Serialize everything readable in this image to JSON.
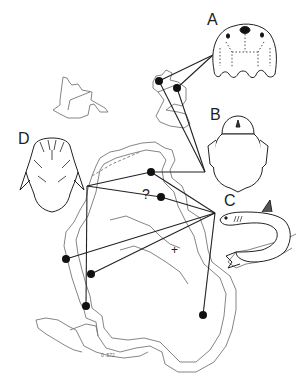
{
  "figure": {
    "type": "distribution map with specimen illustrations",
    "colors": {
      "outline": "#777777",
      "line": "#222222",
      "dot": "#111111",
      "background": "#ffffff"
    }
  },
  "labels": {
    "A": "A",
    "B": "B",
    "C": "C",
    "D": "D",
    "uncertain": "?",
    "cross": "+",
    "map_note": "0 .572"
  },
  "taxa": [
    {
      "id": "A",
      "illustration": "larval-head-capsule",
      "points": [
        [
          159,
          81
        ],
        [
          177,
          88
        ]
      ],
      "apex": [
        213,
        55
      ]
    },
    {
      "id": "B",
      "illustration": "beetle-body",
      "points": [
        [
          159,
          81
        ],
        [
          177,
          88
        ]
      ],
      "apex": [
        205,
        172
      ]
    },
    {
      "id": "C",
      "illustration": "curled-fish",
      "points": [
        [
          151,
          172
        ],
        [
          161,
          197
        ],
        [
          66,
          259
        ],
        [
          91,
          274
        ],
        [
          203,
          315
        ]
      ],
      "apex": [
        215,
        213
      ]
    },
    {
      "id": "D",
      "illustration": "head-capsule",
      "points": [
        [
          151,
          172
        ],
        [
          86,
          306
        ]
      ],
      "apex": [
        87,
        186
      ]
    }
  ]
}
